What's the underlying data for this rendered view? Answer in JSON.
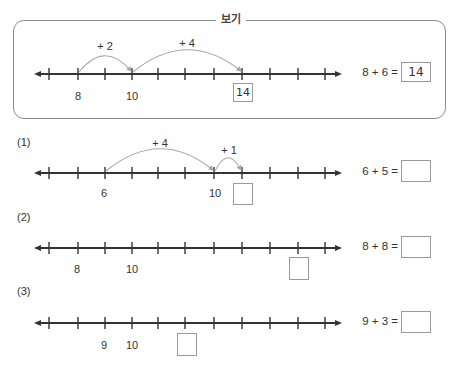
{
  "example": {
    "title": "보기",
    "number_line": {
      "labels": [
        {
          "text": "8",
          "x": 78
        },
        {
          "text": "10",
          "x": 132
        }
      ],
      "jumps": [
        {
          "label": "+ 2",
          "from": 78,
          "to": 132,
          "peak": 56,
          "label_x": 105,
          "label_y": 40
        },
        {
          "label": "+ 4",
          "from": 132,
          "to": 242,
          "peak": 50,
          "label_x": 187,
          "label_y": 37
        }
      ],
      "marked_box": {
        "value": "14",
        "x": 233,
        "y": 83
      }
    },
    "equation": "8 + 6 =",
    "answer": "14"
  },
  "problems": [
    {
      "id": "(1)",
      "labels": [
        {
          "text": "6",
          "x": 104
        },
        {
          "text": "10",
          "x": 215
        }
      ],
      "jumps": [
        {
          "label": "+ 4",
          "from": 105,
          "to": 214,
          "peak": 154,
          "label_x": 160,
          "label_y": 137
        },
        {
          "label": "+ 1",
          "from": 214,
          "to": 242,
          "peak": 160,
          "label_x": 229,
          "label_y": 144
        }
      ],
      "equation": "6 + 5 =",
      "answer": ""
    },
    {
      "id": "(2)",
      "labels": [
        {
          "text": "8",
          "x": 77
        },
        {
          "text": "10",
          "x": 132
        }
      ],
      "jumps": [],
      "equation": "8 + 8 =",
      "answer": ""
    },
    {
      "id": "(3)",
      "labels": [
        {
          "text": "9",
          "x": 104
        },
        {
          "text": "10",
          "x": 132
        }
      ],
      "jumps": [],
      "equation": "9 + 3 =",
      "answer": ""
    }
  ],
  "ticks": [
    49,
    78,
    105,
    132,
    158,
    185,
    214,
    242,
    270,
    298,
    325
  ]
}
